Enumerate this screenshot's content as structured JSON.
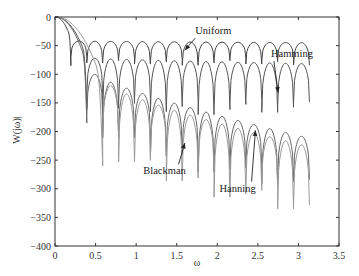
{
  "chart_data": {
    "type": "line",
    "title": "",
    "xlabel": "ω",
    "ylabel": "W(jω)|",
    "xlim": [
      0,
      3.5
    ],
    "ylim": [
      -400,
      0
    ],
    "xticks": [
      0,
      0.5,
      1,
      1.5,
      2,
      2.5,
      3,
      3.5
    ],
    "xtick_labels": [
      "0",
      "0.5",
      "1",
      "1.5",
      "2",
      "2.5",
      "3",
      "3.5"
    ],
    "yticks": [
      0,
      -50,
      -100,
      -150,
      -200,
      -250,
      -300,
      -350,
      -400
    ],
    "ytick_labels": [
      "0",
      "-50",
      "-100",
      "-150",
      "-200",
      "-250",
      "-300",
      "-350",
      "-400"
    ],
    "grid": false,
    "legend": "annotations",
    "x_end": 3.14,
    "series": [
      {
        "name": "Uniform",
        "color": "#444444",
        "null_spacing": 0.196,
        "first_null": 0.196,
        "main_lobe_depth": -85,
        "peak_start": -42,
        "peak_end": -45,
        "null_depth": -35
      },
      {
        "name": "Hamming",
        "color": "#555555",
        "null_spacing": 0.196,
        "first_null": 0.392,
        "main_lobe_depth": -160,
        "peak_start": -72,
        "peak_end": -82,
        "null_depth": -80
      },
      {
        "name": "Hanning",
        "color": "#666666",
        "null_spacing": 0.196,
        "first_null": 0.392,
        "main_lobe_depth": -185,
        "peak_start": -100,
        "peak_end": -215,
        "null_depth": -90
      },
      {
        "name": "Blackman",
        "color": "#9a9a9a",
        "null_spacing": 0.196,
        "first_null": 0.588,
        "main_lobe_depth": -260,
        "peak_start": -120,
        "peak_end": -230,
        "null_depth": -110
      }
    ],
    "annotations": [
      {
        "text": "Uniform",
        "x": 1.95,
        "y": -30,
        "arrow_to": [
          1.6,
          -58
        ]
      },
      {
        "text": "Hamming",
        "x": 2.92,
        "y": -70,
        "arrow_to": [
          2.75,
          -132
        ]
      },
      {
        "text": "Blackman",
        "x": 1.35,
        "y": -275,
        "arrow_to": [
          1.6,
          -220
        ]
      },
      {
        "text": "Hanning",
        "x": 2.25,
        "y": -305,
        "arrow_to": [
          2.47,
          -198
        ]
      }
    ]
  }
}
